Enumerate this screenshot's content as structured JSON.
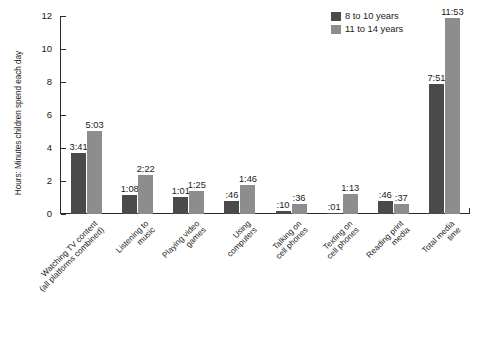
{
  "chart_data": {
    "type": "bar",
    "title": "",
    "xlabel": "",
    "ylabel": "Hours: Minutes children spend each day",
    "ylim": [
      0,
      12
    ],
    "yticks": [
      0,
      2,
      4,
      6,
      8,
      10,
      12
    ],
    "grid": false,
    "legend_position": "top-right",
    "categories": [
      "Watching TV content (all platforms combined)",
      "Listening to music",
      "Playing video games",
      "Using computers",
      "Talking on cell phones",
      "Texting on cell phones",
      "Reading print media",
      "Total media time"
    ],
    "category_lines": [
      [
        "Watching TV content",
        "(all platforms combined)"
      ],
      [
        "Listening to",
        "music"
      ],
      [
        "Playing video",
        "games"
      ],
      [
        "Using",
        "computers"
      ],
      [
        "Talking on",
        "cell phones"
      ],
      [
        "Texting on",
        "cell phones"
      ],
      [
        "Reading print",
        "media"
      ],
      [
        "Total media",
        "time"
      ]
    ],
    "series": [
      {
        "name": "8 to 10 years",
        "color": "#4a4a4a",
        "values": [
          3.683,
          1.133,
          1.017,
          0.767,
          0.167,
          0.017,
          0.767,
          7.85
        ],
        "labels": [
          "3:41",
          "1:08",
          "1:01",
          ":46",
          ":10",
          ":01",
          ":46",
          "7:51"
        ]
      },
      {
        "name": "11 to 14 years",
        "color": "#8d8d8d",
        "values": [
          5.05,
          2.367,
          1.417,
          1.767,
          0.6,
          1.217,
          0.617,
          11.883
        ],
        "labels": [
          "5:03",
          "2:22",
          "1:25",
          "1:46",
          ":36",
          "1:13",
          ":37",
          "11:53"
        ]
      }
    ]
  },
  "legend": {
    "items": [
      {
        "label": "8 to 10 years",
        "color": "#4a4a4a"
      },
      {
        "label": "11 to 14 years",
        "color": "#8d8d8d"
      }
    ]
  }
}
